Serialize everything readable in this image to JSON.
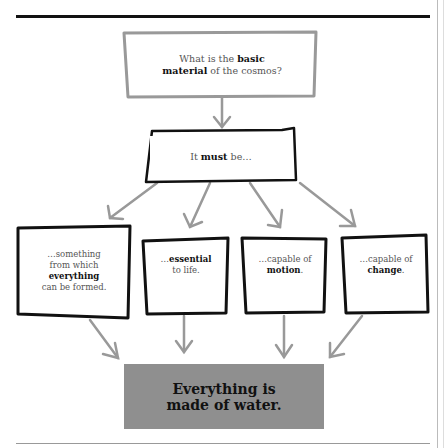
{
  "diagram": {
    "question": {
      "pre": "What is the ",
      "bold1": "basic",
      "bold2": "material",
      "post": " of the cosmos?"
    },
    "premise": {
      "pre": "It ",
      "bold": "must",
      "post": " be…"
    },
    "criteria": [
      {
        "pre": "…something from which ",
        "bold": "everything",
        "post": " can be formed."
      },
      {
        "pre": "…",
        "bold": "essential",
        "post": " to life."
      },
      {
        "pre": "…capable of ",
        "bold": "motion",
        "post": "."
      },
      {
        "pre": "…capable of ",
        "bold": "change",
        "post": "."
      }
    ],
    "conclusion": {
      "line1": "Everything is",
      "line2": "made of water."
    },
    "colors": {
      "arrow": "#999999",
      "conclusion_bg": "#8f8f8f",
      "border": "#111111"
    }
  }
}
